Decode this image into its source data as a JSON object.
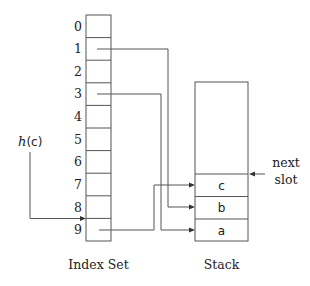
{
  "diagram": {
    "index_set": {
      "label": "Index Set",
      "indices": [
        "0",
        "1",
        "2",
        "3",
        "4",
        "5",
        "6",
        "7",
        "8",
        "9"
      ]
    },
    "stack": {
      "label": "Stack",
      "cells": [
        "c",
        "b",
        "a"
      ],
      "next_slot_label_line1": "next",
      "next_slot_label_line2": "slot"
    },
    "hash": {
      "func": "h",
      "open": "(",
      "arg": "c",
      "close": ")"
    },
    "edges": [
      {
        "from": "index-1",
        "to": "stack-b"
      },
      {
        "from": "index-3",
        "to": "stack-a"
      },
      {
        "from": "index-9",
        "to": "stack-c"
      },
      {
        "from": "h(c)",
        "to": "index-9"
      },
      {
        "from": "next-slot",
        "to": "stack-top"
      }
    ],
    "colors": {
      "line": "#555555",
      "text": "#222222",
      "background": "#ffffff"
    }
  }
}
